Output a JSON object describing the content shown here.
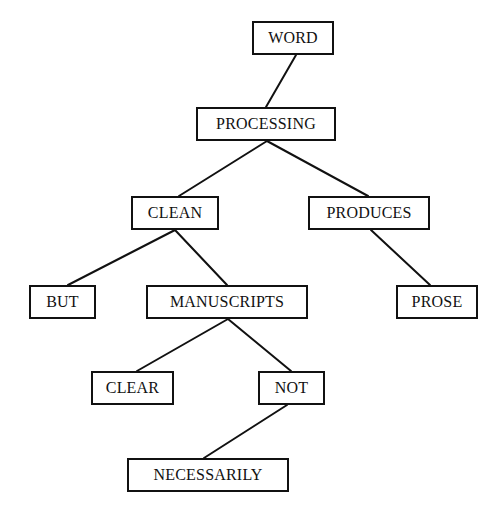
{
  "diagram": {
    "type": "tree",
    "background": "#ffffff",
    "stroke_color": "#111111",
    "nodes": [
      {
        "id": "word",
        "label": "WORD",
        "x": 252,
        "y": 21,
        "w": 82,
        "h": 34
      },
      {
        "id": "processing",
        "label": "PROCESSING",
        "x": 196,
        "y": 107,
        "w": 140,
        "h": 34
      },
      {
        "id": "clean",
        "label": "CLEAN",
        "x": 131,
        "y": 196,
        "w": 88,
        "h": 34
      },
      {
        "id": "produces",
        "label": "PRODUCES",
        "x": 308,
        "y": 196,
        "w": 122,
        "h": 34
      },
      {
        "id": "but",
        "label": "BUT",
        "x": 29,
        "y": 285,
        "w": 67,
        "h": 34
      },
      {
        "id": "manuscripts",
        "label": "MANUSCRIPTS",
        "x": 146,
        "y": 285,
        "w": 162,
        "h": 34
      },
      {
        "id": "prose",
        "label": "PROSE",
        "x": 396,
        "y": 285,
        "w": 82,
        "h": 34
      },
      {
        "id": "clear",
        "label": "CLEAR",
        "x": 91,
        "y": 371,
        "w": 83,
        "h": 34
      },
      {
        "id": "not",
        "label": "NOT",
        "x": 258,
        "y": 371,
        "w": 67,
        "h": 34
      },
      {
        "id": "necessarily",
        "label": "NECESSARILY",
        "x": 127,
        "y": 458,
        "w": 162,
        "h": 34
      }
    ],
    "edges": [
      {
        "from": "word",
        "to": "processing",
        "x1": 296,
        "y1": 55,
        "x2": 266,
        "y2": 107
      },
      {
        "from": "processing",
        "to": "clean",
        "x1": 267,
        "y1": 141,
        "x2": 179,
        "y2": 196
      },
      {
        "from": "processing",
        "to": "produces",
        "x1": 267,
        "y1": 141,
        "x2": 368,
        "y2": 196
      },
      {
        "from": "clean",
        "to": "but",
        "x1": 175,
        "y1": 230,
        "x2": 68,
        "y2": 285
      },
      {
        "from": "clean",
        "to": "manuscripts",
        "x1": 175,
        "y1": 230,
        "x2": 227,
        "y2": 285
      },
      {
        "from": "produces",
        "to": "prose",
        "x1": 371,
        "y1": 230,
        "x2": 430,
        "y2": 285
      },
      {
        "from": "manuscripts",
        "to": "clear",
        "x1": 228,
        "y1": 319,
        "x2": 137,
        "y2": 371
      },
      {
        "from": "manuscripts",
        "to": "not",
        "x1": 228,
        "y1": 319,
        "x2": 291,
        "y2": 371
      },
      {
        "from": "not",
        "to": "necessarily",
        "x1": 287,
        "y1": 405,
        "x2": 204,
        "y2": 458
      }
    ]
  }
}
